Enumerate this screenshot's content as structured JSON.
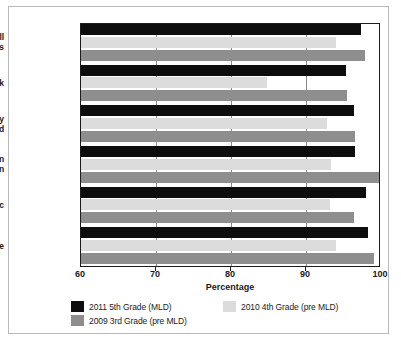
{
  "chart_data": {
    "type": "bar",
    "orientation": "horizontal",
    "title": "",
    "xlabel": "Percentage",
    "ylabel": "",
    "xlim": [
      60,
      100
    ],
    "xticks": [
      60,
      70,
      80,
      90,
      100
    ],
    "grid": true,
    "legend_position": "bottom",
    "categories": [
      "All Students",
      "At Risk",
      "Economically Disadvantaged",
      "African American",
      "Hispanic",
      "White"
    ],
    "category_lines": [
      [
        "All",
        "Students"
      ],
      [
        "At Risk"
      ],
      [
        "Economically",
        "Disadvantaged"
      ],
      [
        "African",
        "American"
      ],
      [
        "Hispanic"
      ],
      [
        "White"
      ]
    ],
    "series": [
      {
        "name": "2011 5th Grade (MLD)",
        "color": "#0d0d0d",
        "values": [
          97.3,
          95.3,
          96.4,
          96.5,
          98.0,
          98.3
        ]
      },
      {
        "name": "2010 4th Grade (pre MLD)",
        "color": "#dcdcdc",
        "values": [
          94.0,
          84.8,
          92.8,
          93.3,
          93.2,
          94.0
        ]
      },
      {
        "name": "2009 3rd Grade (pre MLD)",
        "color": "#8e8e8e",
        "values": [
          97.9,
          95.5,
          96.5,
          100.0,
          96.4,
          99.1
        ]
      }
    ]
  },
  "axis": {
    "tick_labels": [
      "60",
      "70",
      "80",
      "90",
      "100"
    ],
    "x_axis_title": "Percentage"
  },
  "legend": {
    "entries": [
      "2011 5th Grade (MLD)",
      "2010 4th Grade (pre MLD)",
      "2009 3rd Grade (pre MLD)"
    ]
  }
}
